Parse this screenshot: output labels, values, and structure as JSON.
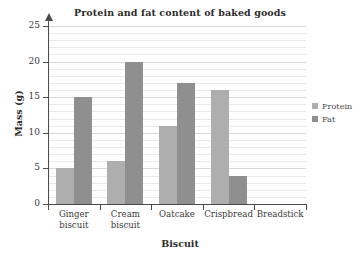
{
  "chart_data": {
    "type": "bar",
    "title": "Protein and fat content of baked goods",
    "xlabel": "Biscuit",
    "ylabel": "Mass (g)",
    "categories": [
      "Ginger biscuit",
      "Cream biscuit",
      "Oatcake",
      "Crispbread",
      "Breadstick"
    ],
    "series": [
      {
        "name": "Protein",
        "color": "#aeaeae",
        "values": [
          5,
          6,
          11,
          16,
          null
        ]
      },
      {
        "name": "Fat",
        "color": "#8f8f8f",
        "values": [
          15,
          20,
          17,
          4,
          null
        ]
      }
    ],
    "ylim": [
      0,
      25
    ],
    "ytick_labels": [
      "0",
      "5",
      "10",
      "15",
      "20",
      "25"
    ],
    "ytick_values": [
      0,
      5,
      10,
      15,
      20,
      25
    ],
    "minor_gridline_step": 1,
    "grid": true,
    "legend_position": "right"
  },
  "legend": {
    "entries": [
      {
        "label": "Protein"
      },
      {
        "label": "Fat"
      }
    ]
  }
}
